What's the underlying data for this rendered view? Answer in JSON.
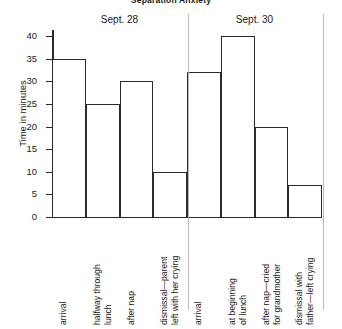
{
  "chart_data": {
    "type": "bar",
    "title": "Separation Anxiety",
    "xlabel": "",
    "ylabel": "Time in minutes",
    "ylim": [
      0,
      40
    ],
    "ytick_step": 5,
    "yticks": [
      40,
      35,
      30,
      25,
      20,
      15,
      10,
      5,
      0
    ],
    "grid": false,
    "legend": null,
    "bar_style": "contiguous-outline",
    "bar_fill": "#ffffff",
    "bar_outline": "#2b2b2b",
    "groups": [
      {
        "name": "Sept. 28",
        "categories": [
          "arrival",
          "halfway through\nlunch",
          "after nap",
          "dismissal—parent\nleft with her crying"
        ],
        "values": [
          35,
          25,
          30,
          10
        ]
      },
      {
        "name": "Sept. 30",
        "categories": [
          "arrival",
          "at beginning\nof lunch",
          "after nap—cried\nfor grandmother",
          "dismissal with\nfather—left crying"
        ],
        "values": [
          32,
          40,
          20,
          7
        ]
      }
    ],
    "categories": [
      "arrival",
      "halfway through lunch",
      "after nap",
      "dismissal—parent left with her crying",
      "arrival",
      "at beginning of lunch",
      "after nap—cried for grandmother",
      "dismissal with father—left crying"
    ],
    "values": [
      35,
      25,
      30,
      10,
      32,
      40,
      20,
      7
    ]
  }
}
